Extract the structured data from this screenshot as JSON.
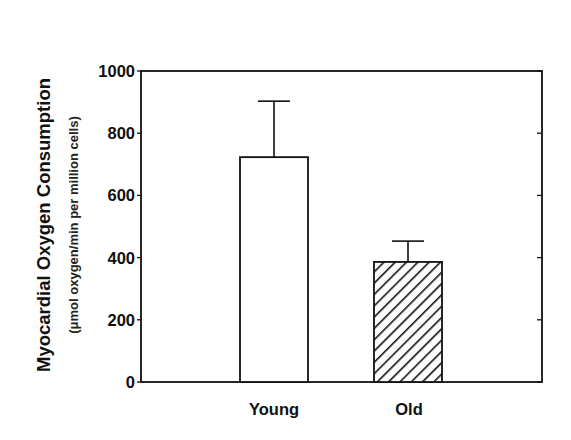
{
  "chart_data": {
    "type": "bar",
    "title": "",
    "xlabel": "",
    "ylabel": "Myocardial Oxygen Consumption",
    "ylabel_units": "(μmol oxygen/min per million cells)",
    "categories": [
      "Young",
      "Old"
    ],
    "values": [
      723,
      386
    ],
    "error_upper": [
      903,
      453
    ],
    "error_plus": [
      180,
      67
    ],
    "bar_fill": [
      "white",
      "diagonal-hatch"
    ],
    "ylim": [
      0,
      1000
    ],
    "yticks": [
      0,
      200,
      400,
      600,
      800,
      1000
    ],
    "ytick_labels": [
      "0",
      "200",
      "400",
      "600",
      "800",
      "1000"
    ],
    "grid": false,
    "legend": null,
    "colors": {
      "line": "#111111",
      "background": "#ffffff"
    }
  }
}
